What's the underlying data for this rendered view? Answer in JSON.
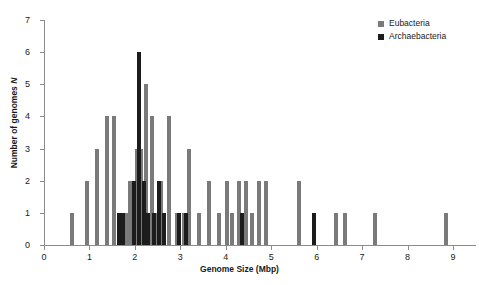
{
  "chart_data": {
    "type": "bar",
    "title": "",
    "xlabel": "Genome Size (Mbp)",
    "ylabel": "Number of genomes N",
    "xlim": [
      0,
      9.5
    ],
    "ylim": [
      0,
      7
    ],
    "xticks": [
      0,
      1,
      2,
      3,
      4,
      5,
      6,
      7,
      8,
      9
    ],
    "yticks": [
      0,
      1,
      2,
      3,
      4,
      5,
      6,
      7
    ],
    "grid": false,
    "bin_width": 0.1,
    "legend_position": "top-right",
    "series": [
      {
        "name": "Eubacteria",
        "color": "#7a7a7a",
        "points": [
          {
            "x": 0.62,
            "y": 1
          },
          {
            "x": 0.95,
            "y": 2
          },
          {
            "x": 1.17,
            "y": 3
          },
          {
            "x": 1.38,
            "y": 4
          },
          {
            "x": 1.53,
            "y": 4
          },
          {
            "x": 1.8,
            "y": 1
          },
          {
            "x": 1.9,
            "y": 2
          },
          {
            "x": 2.04,
            "y": 3
          },
          {
            "x": 2.14,
            "y": 3
          },
          {
            "x": 2.24,
            "y": 5
          },
          {
            "x": 2.37,
            "y": 4
          },
          {
            "x": 2.47,
            "y": 1
          },
          {
            "x": 2.58,
            "y": 2
          },
          {
            "x": 2.75,
            "y": 4
          },
          {
            "x": 2.92,
            "y": 1
          },
          {
            "x": 3.08,
            "y": 1
          },
          {
            "x": 3.2,
            "y": 3
          },
          {
            "x": 3.42,
            "y": 1
          },
          {
            "x": 3.62,
            "y": 2
          },
          {
            "x": 3.84,
            "y": 1
          },
          {
            "x": 4.02,
            "y": 2
          },
          {
            "x": 4.13,
            "y": 1
          },
          {
            "x": 4.3,
            "y": 2
          },
          {
            "x": 4.44,
            "y": 2
          },
          {
            "x": 4.58,
            "y": 1
          },
          {
            "x": 4.74,
            "y": 2
          },
          {
            "x": 4.88,
            "y": 2
          },
          {
            "x": 5.62,
            "y": 2
          },
          {
            "x": 6.42,
            "y": 1
          },
          {
            "x": 6.62,
            "y": 1
          },
          {
            "x": 7.28,
            "y": 1
          },
          {
            "x": 8.84,
            "y": 1
          }
        ]
      },
      {
        "name": "Archaebacteria",
        "color": "#1c1c1c",
        "points": [
          {
            "x": 1.66,
            "y": 1
          },
          {
            "x": 1.74,
            "y": 1
          },
          {
            "x": 1.97,
            "y": 2
          },
          {
            "x": 2.09,
            "y": 6
          },
          {
            "x": 2.19,
            "y": 2
          },
          {
            "x": 2.29,
            "y": 1
          },
          {
            "x": 2.42,
            "y": 1
          },
          {
            "x": 2.52,
            "y": 2
          },
          {
            "x": 2.65,
            "y": 1
          },
          {
            "x": 2.98,
            "y": 1
          },
          {
            "x": 3.13,
            "y": 1
          },
          {
            "x": 4.36,
            "y": 1
          },
          {
            "x": 5.95,
            "y": 1
          }
        ]
      }
    ]
  },
  "legend": {
    "items": [
      {
        "label": "Eubacteria",
        "swatch": "eu"
      },
      {
        "label": "Archaebacteria",
        "swatch": "ar"
      }
    ]
  },
  "axes": {
    "x_title": "Genome Size (Mbp)",
    "y_title_main": "Number of genomes ",
    "y_title_italic": "N",
    "x_tick_labels": [
      "0",
      "1",
      "2",
      "3",
      "4",
      "5",
      "6",
      "7",
      "8",
      "9"
    ],
    "y_tick_labels": [
      "0",
      "1",
      "2",
      "3",
      "4",
      "5",
      "6",
      "7"
    ]
  }
}
